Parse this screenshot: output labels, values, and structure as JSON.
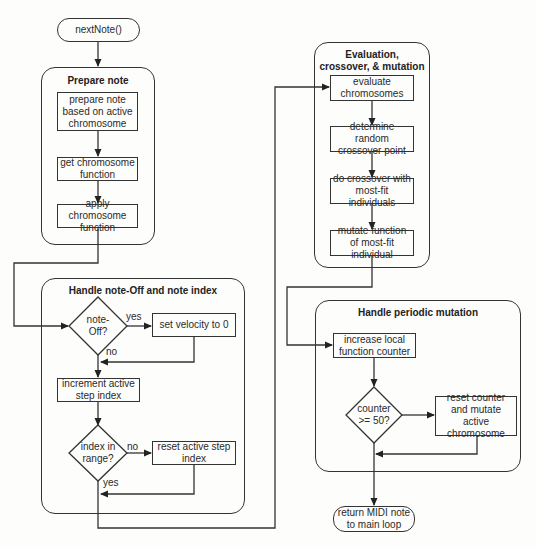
{
  "diagram": {
    "type": "flowchart",
    "start": {
      "label": "nextNote()"
    },
    "end": {
      "label": "return MIDI note to main loop"
    },
    "groups": [
      {
        "id": "prepare",
        "title": "Prepare note",
        "steps": [
          "prepare note based on active chromosome",
          "get chromosome function",
          "apply chromosome function"
        ]
      },
      {
        "id": "noteoff",
        "title": "Handle note-Off and note index",
        "decision1": {
          "question": "note-Off?",
          "yes_label": "yes",
          "no_label": "no",
          "yes_action": "set velocity to 0"
        },
        "step": "increment active step index",
        "decision2": {
          "question": "index in range?",
          "no_label": "no",
          "yes_label": "yes",
          "no_action": "reset active step index"
        }
      },
      {
        "id": "evaluation",
        "title": "Evaluation, crossover, & mutation",
        "steps": [
          "evaluate chromosomes",
          "determine random crossover point",
          "do crossover with most-fit individuals",
          "mutate function of most-fit individual"
        ]
      },
      {
        "id": "periodic",
        "title": "Handle periodic mutation",
        "step": "increase local function counter",
        "decision": {
          "question": "counter >= 50?",
          "yes_action": "reset counter and mutate active chromosome"
        }
      }
    ],
    "labels": {
      "start": "nextNote()",
      "g1_title": "Prepare note",
      "g1_s1": "prepare note based on active chromosome",
      "g1_s2": "get chromosome function",
      "g1_s3": "apply chromosome function",
      "g2_title": "Handle note-Off and note index",
      "g2_d1": "note-Off?",
      "g2_d1_yes": "yes",
      "g2_d1_no": "no",
      "g2_a1": "set velocity to 0",
      "g2_s1": "increment active step index",
      "g2_d2": "index in range?",
      "g2_d2_no": "no",
      "g2_d2_yes": "yes",
      "g2_a2": "reset active step index",
      "g3_title": "Evaluation, crossover, & mutation",
      "g3_s1": "evaluate chromosomes",
      "g3_s2": "determine random crossover point",
      "g3_s3": "do crossover with most-fit individuals",
      "g3_s4": "mutate function of most-fit individual",
      "g4_title": "Handle periodic mutation",
      "g4_s1": "increase local function counter",
      "g4_d1": "counter >= 50?",
      "g4_a1": "reset counter and mutate active chromosome",
      "end": "return MIDI note to main loop"
    },
    "colors": {
      "line": "#333333",
      "background": "#fdfdfb",
      "text": "#2a2a2a"
    }
  }
}
